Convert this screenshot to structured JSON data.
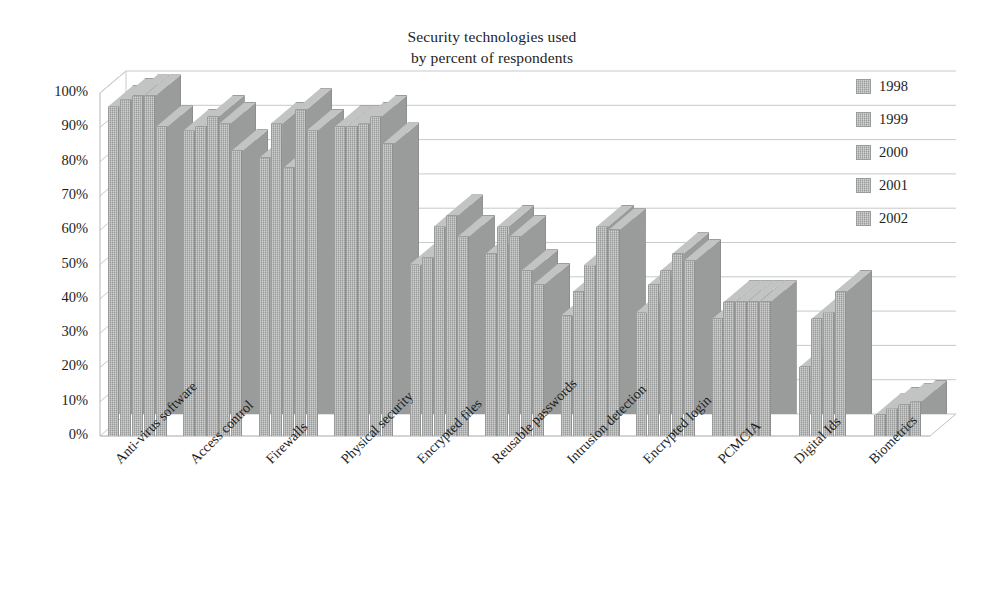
{
  "chart_data": {
    "type": "bar",
    "title": "Security technologies used by percent of respondents",
    "title_lines": [
      "Security technologies used",
      "by percent of respondents"
    ],
    "xlabel": "",
    "ylabel": "",
    "ylim": [
      0,
      100
    ],
    "ytick_labels": [
      "100%",
      "90%",
      "80%",
      "70%",
      "60%",
      "50%",
      "40%",
      "30%",
      "20%",
      "10%",
      "0%"
    ],
    "ytick_values": [
      100,
      90,
      80,
      70,
      60,
      50,
      40,
      30,
      20,
      10,
      0
    ],
    "grid": true,
    "legend_position": "right",
    "style": "3d-clustered-column",
    "bar_color": "#a9aaaa",
    "categories": [
      "Anti-virus software",
      "Access control",
      "Firewalls",
      "Physical security",
      "Encrypted files",
      "Reusable passwords",
      "Intrusion detection",
      "Encrypted login",
      "PCMCIA",
      "Digital Ids",
      "Biometrics"
    ],
    "series": [
      {
        "name": "1998",
        "values": [
          96,
          89,
          81,
          90,
          50,
          53,
          35,
          36,
          34,
          0,
          0
        ]
      },
      {
        "name": "1999",
        "values": [
          98,
          90,
          91,
          90,
          52,
          61,
          42,
          44,
          39,
          20,
          6
        ]
      },
      {
        "name": "2000",
        "values": [
          99,
          93,
          78,
          91,
          61,
          58,
          50,
          48,
          39,
          34,
          8
        ]
      },
      {
        "name": "2001",
        "values": [
          99,
          91,
          95,
          93,
          64,
          48,
          61,
          53,
          39,
          36,
          9
        ]
      },
      {
        "name": "2002",
        "values": [
          90,
          83,
          89,
          85,
          58,
          44,
          60,
          51,
          39,
          42,
          10
        ]
      }
    ]
  },
  "axis": {
    "y_min_label": "0%",
    "y_max_label": "100%"
  }
}
